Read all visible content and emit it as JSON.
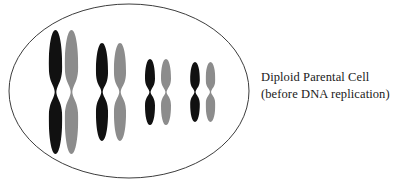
{
  "figure": {
    "background_color": "#ffffff"
  },
  "cell": {
    "name": "cell-membrane-ellipse",
    "shape": "ellipse",
    "center_x": 129,
    "center_y": 91,
    "radius_x": 120,
    "radius_y": 87,
    "stroke_color": "#3d3d3d",
    "stroke_width": 1,
    "fill_color": "none"
  },
  "chromosome_colors": {
    "maternal": "#111111",
    "paternal": "#8c8c8c"
  },
  "chromosome_pairs": [
    {
      "pair_label": "pair-1",
      "size": "largest",
      "chromosomes": [
        {
          "name": "chromosome-1-black",
          "origin": "maternal",
          "color": "#111111",
          "center_x": 55.5,
          "center_y": 92,
          "half_height": 62,
          "half_width": 7.0
        },
        {
          "name": "chromosome-1-gray",
          "origin": "paternal",
          "color": "#8c8c8c",
          "center_x": 71.5,
          "center_y": 92,
          "half_height": 62,
          "half_width": 7.0
        }
      ]
    },
    {
      "pair_label": "pair-2",
      "size": "large",
      "chromosomes": [
        {
          "name": "chromosome-2-black",
          "origin": "maternal",
          "color": "#111111",
          "center_x": 102.0,
          "center_y": 92,
          "half_height": 49,
          "half_width": 6.3
        },
        {
          "name": "chromosome-2-gray",
          "origin": "paternal",
          "color": "#8c8c8c",
          "center_x": 120.0,
          "center_y": 92,
          "half_height": 49,
          "half_width": 6.3
        }
      ]
    },
    {
      "pair_label": "pair-3",
      "size": "small",
      "chromosomes": [
        {
          "name": "chromosome-3-black",
          "origin": "maternal",
          "color": "#111111",
          "center_x": 150.0,
          "center_y": 92,
          "half_height": 33,
          "half_width": 5.2
        },
        {
          "name": "chromosome-3-gray",
          "origin": "paternal",
          "color": "#8c8c8c",
          "center_x": 166.0,
          "center_y": 92,
          "half_height": 33,
          "half_width": 5.2
        }
      ]
    },
    {
      "pair_label": "pair-4",
      "size": "smallest",
      "chromosomes": [
        {
          "name": "chromosome-4-black",
          "origin": "maternal",
          "color": "#111111",
          "center_x": 195.0,
          "center_y": 92,
          "half_height": 30,
          "half_width": 5.0
        },
        {
          "name": "chromosome-4-gray",
          "origin": "paternal",
          "color": "#8c8c8c",
          "center_x": 210.5,
          "center_y": 92,
          "half_height": 30,
          "half_width": 5.0
        }
      ]
    }
  ],
  "caption": {
    "line1": "Diploid Parental Cell",
    "line2": "(before DNA replication)",
    "color": "#1a1a1a"
  }
}
